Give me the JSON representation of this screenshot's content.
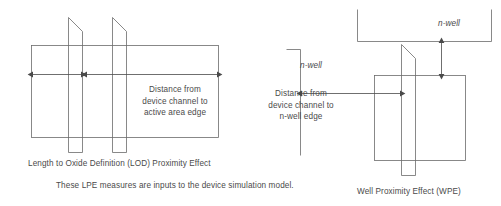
{
  "figure": {
    "stroke_color": "#6b6b6b",
    "text_color": "#4a4a4a",
    "background_color": "#ffffff"
  },
  "left_diagram": {
    "name": "Length to Oxide Definition (LOD) Proximity Effect",
    "caption": "Length to Oxide Definition (LOD) Proximity Effect",
    "annotation": {
      "line1": "Distance from",
      "line2": "device channel to",
      "line3": "active area edge"
    },
    "measures": [
      {
        "name": "left-lod-measure",
        "label": ""
      },
      {
        "name": "right-lod-measure",
        "label": ""
      }
    ]
  },
  "right_diagram": {
    "name": "Well Proximity Effect (WPE)",
    "caption": "Well Proximity Effect (WPE)",
    "annotation": {
      "line1": "Distance from",
      "line2": "device channel to",
      "line3": "n-well edge"
    },
    "nwell_label_left": "n-well",
    "nwell_label_top": "n-well",
    "measures": [
      {
        "name": "horizontal-nwell-distance",
        "label": ""
      },
      {
        "name": "vertical-nwell-distance",
        "label": ""
      }
    ]
  },
  "footnote": {
    "text": "These LPE measures are inputs to the device simulation model."
  }
}
